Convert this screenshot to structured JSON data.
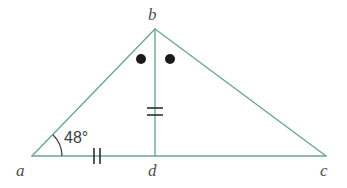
{
  "figure": {
    "background_color": "#ffffff",
    "line_color": "#6aa894",
    "mark_color": "#2e2e2e",
    "label_color": "#4d4d4d",
    "stroke_width": 1.4
  },
  "vertices": [
    {
      "id": "a",
      "label": "a",
      "x": 32,
      "y": 156,
      "label_x": 16,
      "label_y": 176
    },
    {
      "id": "b",
      "label": "b",
      "x": 155,
      "y": 29,
      "label_x": 148,
      "label_y": 20
    },
    {
      "id": "c",
      "label": "c",
      "x": 326,
      "y": 156,
      "label_x": 320,
      "label_y": 176
    },
    {
      "id": "d",
      "label": "d",
      "x": 155,
      "y": 156,
      "label_x": 148,
      "label_y": 176
    }
  ],
  "segments": [
    {
      "id": "ab",
      "from": "a",
      "to": "b",
      "x1": 32,
      "y1": 156,
      "x2": 155,
      "y2": 29
    },
    {
      "id": "bc",
      "from": "b",
      "to": "c",
      "x1": 155,
      "y1": 29,
      "x2": 326,
      "y2": 156
    },
    {
      "id": "ac",
      "from": "a",
      "to": "c",
      "x1": 32,
      "y1": 156,
      "x2": 326,
      "y2": 156
    },
    {
      "id": "bd",
      "from": "b",
      "to": "d",
      "x1": 155,
      "y1": 29,
      "x2": 155,
      "y2": 156
    }
  ],
  "angles": [
    {
      "id": "angle-a",
      "vertex": "a",
      "measure_label": "48°",
      "measure_value": 48,
      "unit": "degrees",
      "label_x": 64,
      "label_y": 143,
      "arc_radius": 30,
      "arc_path": "M 62 156 A 30 30 0 0 0 52.9 134.7"
    }
  ],
  "congruence_marks": [
    {
      "id": "mark-ad",
      "on_segment": "ad",
      "type": "double-tick",
      "orientation": "vertical",
      "count": 2,
      "ticks": [
        {
          "x1": 94,
          "y1": 148,
          "x2": 94,
          "y2": 164
        },
        {
          "x1": 100,
          "y1": 148,
          "x2": 100,
          "y2": 164
        }
      ]
    },
    {
      "id": "mark-bd",
      "on_segment": "bd",
      "type": "double-tick",
      "orientation": "horizontal",
      "count": 2,
      "ticks": [
        {
          "x1": 147,
          "y1": 108,
          "x2": 163,
          "y2": 108
        },
        {
          "x1": 147,
          "y1": 115,
          "x2": 163,
          "y2": 115
        }
      ]
    }
  ],
  "angle_dots": [
    {
      "id": "dot-abd",
      "in_angle": "abd",
      "cx": 141,
      "cy": 59,
      "r": 5
    },
    {
      "id": "dot-dbc",
      "in_angle": "dbc",
      "cx": 170,
      "cy": 59,
      "r": 5
    }
  ]
}
